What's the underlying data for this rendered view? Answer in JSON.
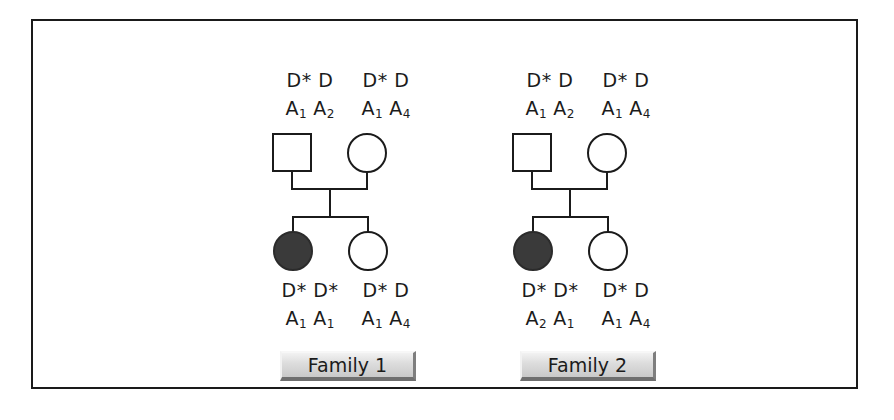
{
  "figure": {
    "type": "pedigree-diagram",
    "background_color": "#ffffff",
    "frame_color": "#1a1a1a",
    "affected_fill_color": "#3a3a3a",
    "symbol_outline_color": "#1b1b1b"
  },
  "families": [
    {
      "id": "family-1",
      "label": "Family 1",
      "parents": [
        {
          "role": "father",
          "symbol": "square",
          "sex": "male",
          "affected": false,
          "disease_genotype": "D* D",
          "marker_allele_1": "A",
          "marker_allele_1_sub": "1",
          "marker_allele_2": "A",
          "marker_allele_2_sub": "2"
        },
        {
          "role": "mother",
          "symbol": "circle",
          "sex": "female",
          "affected": false,
          "disease_genotype": "D* D",
          "marker_allele_1": "A",
          "marker_allele_1_sub": "1",
          "marker_allele_2": "A",
          "marker_allele_2_sub": "4"
        }
      ],
      "children": [
        {
          "role": "daughter-affected",
          "symbol": "circle",
          "sex": "female",
          "affected": true,
          "disease_genotype": "D* D*",
          "marker_allele_1": "A",
          "marker_allele_1_sub": "1",
          "marker_allele_2": "A",
          "marker_allele_2_sub": "1"
        },
        {
          "role": "daughter-unaffected",
          "symbol": "circle",
          "sex": "female",
          "affected": false,
          "disease_genotype": "D* D",
          "marker_allele_1": "A",
          "marker_allele_1_sub": "1",
          "marker_allele_2": "A",
          "marker_allele_2_sub": "4"
        }
      ]
    },
    {
      "id": "family-2",
      "label": "Family 2",
      "parents": [
        {
          "role": "father",
          "symbol": "square",
          "sex": "male",
          "affected": false,
          "disease_genotype": "D* D",
          "marker_allele_1": "A",
          "marker_allele_1_sub": "1",
          "marker_allele_2": "A",
          "marker_allele_2_sub": "2"
        },
        {
          "role": "mother",
          "symbol": "circle",
          "sex": "female",
          "affected": false,
          "disease_genotype": "D* D",
          "marker_allele_1": "A",
          "marker_allele_1_sub": "1",
          "marker_allele_2": "A",
          "marker_allele_2_sub": "4"
        }
      ],
      "children": [
        {
          "role": "daughter-affected",
          "symbol": "circle",
          "sex": "female",
          "affected": true,
          "disease_genotype": "D* D*",
          "marker_allele_1": "A",
          "marker_allele_1_sub": "2",
          "marker_allele_2": "A",
          "marker_allele_2_sub": "1"
        },
        {
          "role": "daughter-unaffected",
          "symbol": "circle",
          "sex": "female",
          "affected": false,
          "disease_genotype": "D* D",
          "marker_allele_1": "A",
          "marker_allele_1_sub": "1",
          "marker_allele_2": "A",
          "marker_allele_2_sub": "4"
        }
      ]
    }
  ]
}
